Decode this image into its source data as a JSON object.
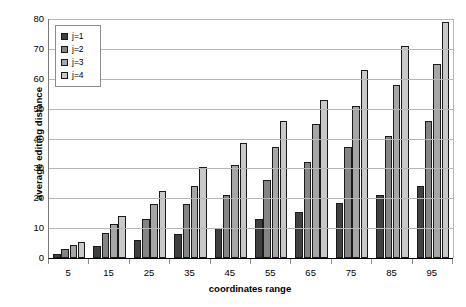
{
  "chart_data": {
    "type": "bar",
    "title": "",
    "subtitle": "",
    "xlabel": "coordinates range",
    "ylabel": "average editing distance",
    "categories": [
      "5",
      "15",
      "25",
      "35",
      "45",
      "55",
      "65",
      "75",
      "85",
      "95"
    ],
    "series": [
      {
        "name": "j=1",
        "color": "#404040",
        "values": [
          1.3,
          4,
          6,
          8,
          10,
          13,
          15.5,
          18.5,
          21,
          24
        ]
      },
      {
        "name": "j=2",
        "color": "#848484",
        "values": [
          3,
          8.5,
          13,
          18,
          21,
          26,
          32,
          37,
          41,
          46
        ]
      },
      {
        "name": "j=3",
        "color": "#a6a6a6",
        "values": [
          4.3,
          11.5,
          18,
          24,
          31,
          37,
          45,
          51,
          58,
          65
        ]
      },
      {
        "name": "j=4",
        "color": "#c9c9c9",
        "values": [
          5.3,
          14,
          22.5,
          30.5,
          38.5,
          46,
          53,
          63,
          71,
          79
        ]
      }
    ],
    "ylim": [
      0,
      80
    ],
    "yticks": [
      0,
      10,
      20,
      30,
      40,
      50,
      60,
      70,
      80
    ],
    "grid": true,
    "legend_position": "upper-left-inside",
    "legend_entries": [
      "j=1",
      "j=2",
      "j=3",
      "j=4"
    ]
  }
}
